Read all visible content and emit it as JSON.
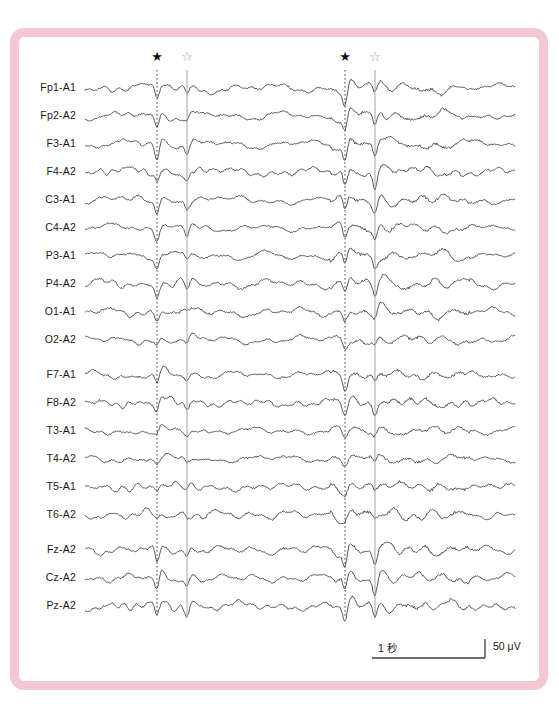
{
  "figure": {
    "frame_color": "#f3c8d3",
    "background": "#ffffff",
    "trace_color": "#3b3b3b"
  },
  "scale": {
    "time_label": "1 秒",
    "amplitude_label": "50 μV"
  },
  "markers": {
    "filled_star_glyph": "★",
    "hollow_star_glyph": "☆",
    "items": [
      {
        "name": "spike-marker-1",
        "glyph": "★",
        "style": "filled",
        "x": 157
      },
      {
        "name": "spike-marker-2",
        "glyph": "☆",
        "style": "hollow",
        "x": 187
      },
      {
        "name": "spike-marker-3",
        "glyph": "★",
        "style": "filled",
        "x": 345
      },
      {
        "name": "spike-marker-4",
        "glyph": "☆",
        "style": "hollow",
        "x": 375
      }
    ]
  },
  "chart_data": {
    "type": "line",
    "title": "",
    "subtitle": "",
    "xlabel": "",
    "ylabel": "",
    "grid": false,
    "legend_position": "none",
    "x_axis": {
      "unit": "second",
      "scalebar_seconds": 1,
      "scalebar_label": "1 秒"
    },
    "y_axis": {
      "unit": "microvolt",
      "scalebar_microvolts": 50,
      "scalebar_label": "50 μV"
    },
    "annotations": [
      {
        "type": "vertical-line",
        "style": "dotted",
        "x_px": 157,
        "marker": "★"
      },
      {
        "type": "vertical-line",
        "style": "solid",
        "x_px": 187,
        "marker": "☆"
      },
      {
        "type": "vertical-line",
        "style": "dotted",
        "x_px": 345,
        "marker": "★"
      },
      {
        "type": "vertical-line",
        "style": "solid",
        "x_px": 375,
        "marker": "☆"
      }
    ],
    "channel_groups": [
      {
        "name": "bipolar-longitudinal",
        "channels": [
          "Fp1-A1",
          "Fp2-A2",
          "F3-A1",
          "F4-A2",
          "C3-A1",
          "C4-A2",
          "P3-A1",
          "P4-A2",
          "O1-A1",
          "O2-A2"
        ]
      },
      {
        "name": "temporal",
        "channels": [
          "F7-A1",
          "F8-A2",
          "T3-A1",
          "T4-A2",
          "T5-A1",
          "T6-A2"
        ]
      },
      {
        "name": "midline",
        "channels": [
          "Fz-A2",
          "Cz-A2",
          "Pz-A2"
        ]
      }
    ],
    "series": [
      {
        "name": "Fp1-A1",
        "label": "Fp1-A1",
        "baseline_y": 88
      },
      {
        "name": "Fp2-A2",
        "label": "Fp2-A2",
        "baseline_y": 116
      },
      {
        "name": "F3-A1",
        "label": "F3-A1",
        "baseline_y": 144
      },
      {
        "name": "F4-A2",
        "label": "F4-A2",
        "baseline_y": 172
      },
      {
        "name": "C3-A1",
        "label": "C3-A1",
        "baseline_y": 200
      },
      {
        "name": "C4-A2",
        "label": "C4-A2",
        "baseline_y": 228
      },
      {
        "name": "P3-A1",
        "label": "P3-A1",
        "baseline_y": 256
      },
      {
        "name": "P4-A2",
        "label": "P4-A2",
        "baseline_y": 284
      },
      {
        "name": "O1-A1",
        "label": "O1-A1",
        "baseline_y": 312
      },
      {
        "name": "O2-A2",
        "label": "O2-A2",
        "baseline_y": 340
      },
      {
        "name": "F7-A1",
        "label": "F7-A1",
        "baseline_y": 375
      },
      {
        "name": "F8-A2",
        "label": "F8-A2",
        "baseline_y": 403
      },
      {
        "name": "T3-A1",
        "label": "T3-A1",
        "baseline_y": 431
      },
      {
        "name": "T4-A2",
        "label": "T4-A2",
        "baseline_y": 459
      },
      {
        "name": "T5-A1",
        "label": "T5-A1",
        "baseline_y": 487
      },
      {
        "name": "T6-A2",
        "label": "T6-A2",
        "baseline_y": 515
      },
      {
        "name": "Fz-A2",
        "label": "Fz-A2",
        "baseline_y": 550
      },
      {
        "name": "Cz-A2",
        "label": "Cz-A2",
        "baseline_y": 578
      },
      {
        "name": "Pz-A2",
        "label": "Pz-A2",
        "baseline_y": 606
      }
    ],
    "spike_amplitudes": {
      "Fp1-A1": [
        14,
        7,
        16,
        9
      ],
      "Fp2-A2": [
        11,
        6,
        15,
        12
      ],
      "F3-A1": [
        17,
        8,
        18,
        13
      ],
      "F4-A2": [
        12,
        9,
        16,
        15
      ],
      "C3-A1": [
        13,
        7,
        14,
        11
      ],
      "C4-A2": [
        10,
        11,
        13,
        12
      ],
      "P3-A1": [
        12,
        6,
        12,
        9
      ],
      "P4-A2": [
        9,
        7,
        11,
        10
      ],
      "O1-A1": [
        8,
        5,
        10,
        8
      ],
      "O2-A2": [
        7,
        5,
        9,
        7
      ],
      "F7-A1": [
        10,
        5,
        12,
        8
      ],
      "F8-A2": [
        11,
        6,
        10,
        9
      ],
      "T3-A1": [
        6,
        4,
        7,
        6
      ],
      "T4-A2": [
        5,
        4,
        6,
        6
      ],
      "T5-A1": [
        4,
        3,
        6,
        5
      ],
      "T6-A2": [
        3,
        3,
        5,
        4
      ],
      "Fz-A2": [
        16,
        8,
        17,
        14
      ],
      "Cz-A2": [
        14,
        9,
        16,
        15
      ],
      "Pz-A2": [
        13,
        8,
        14,
        12
      ]
    }
  }
}
